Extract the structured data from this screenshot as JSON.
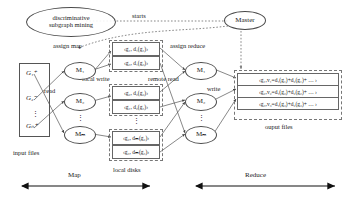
{
  "diagram": {
    "title_node": {
      "line1": "discriminative",
      "line2": "subgraph mining"
    },
    "master_node": "Master",
    "edge_labels": {
      "starts": "starts",
      "assign_map": "assign map",
      "assign_reduce": "assign reduce",
      "read": "read",
      "local_write": "local write",
      "remote_read": "remote read",
      "write": "write"
    },
    "section_labels": {
      "input_files": "input files",
      "local_disks": "local disks",
      "output_files": "ouput files",
      "map": "Map",
      "reduce": "Reduce"
    },
    "input_files": {
      "items": [
        "G₁⁺",
        "G₂⁻",
        "Gₙ⁺"
      ],
      "ellipsis": "⋮"
    },
    "mappers": {
      "items": [
        "M₁",
        "M₂",
        "Mₘ"
      ],
      "ellipsis": "⋮"
    },
    "reducers": {
      "items": [
        "M₁",
        "M₂",
        "Mₘ"
      ],
      "ellipsis": "⋮"
    },
    "local_disks": {
      "groups": [
        {
          "rows": [
            "‹g₁, d₁(g₁)›",
            "‹g₃, d₁(g₃)›"
          ]
        },
        {
          "rows": [
            "‹g₂, d₂(g₂)›",
            "‹g₁, d₂(g₁)›"
          ]
        },
        {
          "rows": [
            "‹g₂, dₘ(g₂)›",
            "‹g₃, dₘ(g₃)›"
          ]
        }
      ],
      "ellipsis": "⋮"
    },
    "output_files": {
      "rows": [
        "‹g₁,v₁=d₁(g₁)+d₂(g₁)+ … ›",
        "‹g₂,v₂=d₁(g₂)+d₂(g₂)+ … ›",
        "‹g₃,v₃=d₁(g₃)+d₂(g₃)+ … ›"
      ]
    },
    "colors": {
      "stroke": "#4a4a4a",
      "dashed": "#777777",
      "text": "#1a1a1a",
      "background": "#ffffff"
    }
  }
}
